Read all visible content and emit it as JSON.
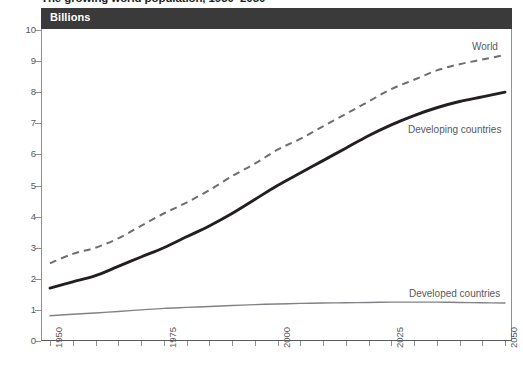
{
  "title": "The growing world population, 1950–2050",
  "unit_band": {
    "label": "Billions"
  },
  "axes": {
    "y": {
      "label": "Billions",
      "min": 0,
      "max": 10,
      "ticks": [
        "0",
        "1",
        "2",
        "3",
        "4",
        "5",
        "6",
        "7",
        "8",
        "9",
        "10"
      ]
    },
    "x": {
      "min": 1950,
      "max": 2050,
      "tick_step": 5,
      "labels": [
        "1950",
        "1975",
        "2000",
        "2025",
        "2050"
      ],
      "label_values": [
        1950,
        1975,
        2000,
        2025,
        2050
      ],
      "minor_ticks": [
        1950,
        1955,
        1960,
        1965,
        1970,
        1975,
        1980,
        1985,
        1990,
        1995,
        2000,
        2005,
        2010,
        2015,
        2020,
        2025,
        2030,
        2035,
        2040,
        2045,
        2050
      ]
    }
  },
  "annotations": {
    "world": "World",
    "developing": "Developing countries",
    "developed": "Developed countries"
  },
  "colors": {
    "band_background": "#3a3a3a",
    "band_text": "#ffffff",
    "world_line": "#6d6e70",
    "developing_line": "#231f20",
    "developed_line": "#808285",
    "axis": "#8e9192",
    "tick_text": "#58595b",
    "title_text": "#231f20",
    "plot_background": "#ffffff"
  },
  "chart_data": {
    "type": "line",
    "title": "The growing world population, 1950–2050",
    "subtitle": "Billions",
    "xlabel": "",
    "ylabel": "Billions",
    "xlim": [
      1950,
      2050
    ],
    "ylim": [
      0,
      10
    ],
    "grid": false,
    "legend": "inline annotations at right of each line",
    "x": [
      1950,
      1955,
      1960,
      1965,
      1970,
      1975,
      1980,
      1985,
      1990,
      1995,
      2000,
      2005,
      2010,
      2015,
      2020,
      2025,
      2030,
      2035,
      2040,
      2045,
      2050
    ],
    "series": [
      {
        "name": "World",
        "style": "dashed",
        "color": "#6d6e70",
        "values": [
          2.5,
          2.8,
          3.0,
          3.3,
          3.7,
          4.1,
          4.45,
          4.85,
          5.3,
          5.7,
          6.15,
          6.5,
          6.9,
          7.3,
          7.7,
          8.1,
          8.4,
          8.7,
          8.9,
          9.05,
          9.2
        ]
      },
      {
        "name": "Developing countries",
        "style": "solid-thick",
        "color": "#231f20",
        "values": [
          1.7,
          1.9,
          2.1,
          2.4,
          2.7,
          3.0,
          3.35,
          3.7,
          4.1,
          4.55,
          5.0,
          5.4,
          5.8,
          6.2,
          6.6,
          6.95,
          7.25,
          7.5,
          7.7,
          7.85,
          8.0
        ]
      },
      {
        "name": "Developed countries",
        "style": "solid-thin",
        "color": "#808285",
        "values": [
          0.81,
          0.86,
          0.9,
          0.95,
          1.0,
          1.05,
          1.08,
          1.11,
          1.14,
          1.17,
          1.19,
          1.21,
          1.22,
          1.23,
          1.24,
          1.25,
          1.25,
          1.25,
          1.24,
          1.23,
          1.22
        ]
      }
    ]
  }
}
